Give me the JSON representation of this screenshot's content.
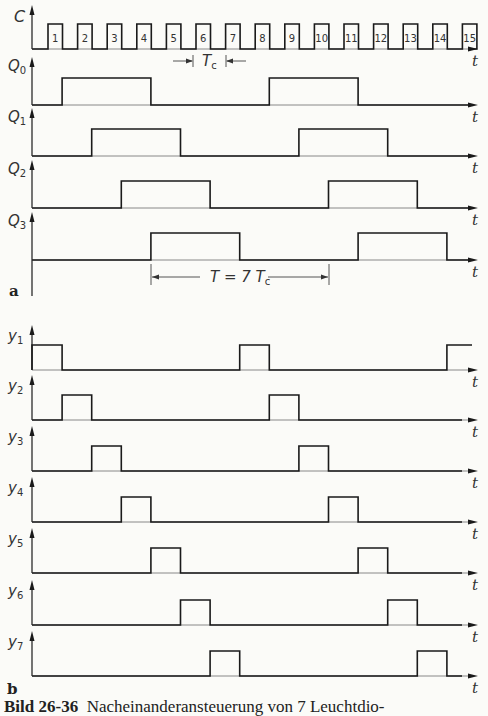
{
  "figure": {
    "caption_number": "Bild 26-36",
    "caption_text": "Nacheinanderansteuerung von 7 Leuchtdio-",
    "panel_a_label": "a",
    "panel_b_label": "b",
    "time_axis_label": "t",
    "clock_period_label": "T",
    "clock_period_sub": "c",
    "cycle_label": "T = 7 T",
    "cycle_label_sub": "c"
  },
  "colors": {
    "line": "#1a1a1a",
    "background": "#fbfbf8"
  },
  "chart_data": {
    "type": "timing",
    "xlabel": "t",
    "time_unit": "clock periods T_c",
    "clock": {
      "name": "C",
      "pulses": [
        1,
        2,
        3,
        4,
        5,
        6,
        7,
        8,
        9,
        10,
        11,
        12,
        13,
        14,
        15
      ]
    },
    "panel_a": [
      {
        "name": "Q",
        "sub": "0",
        "high_intervals": [
          [
            1,
            4
          ],
          [
            8,
            11
          ]
        ]
      },
      {
        "name": "Q",
        "sub": "1",
        "high_intervals": [
          [
            2,
            5
          ],
          [
            9,
            12
          ]
        ]
      },
      {
        "name": "Q",
        "sub": "2",
        "high_intervals": [
          [
            3,
            6
          ],
          [
            10,
            13
          ]
        ]
      },
      {
        "name": "Q",
        "sub": "3",
        "high_intervals": [
          [
            4,
            7
          ],
          [
            11,
            14
          ]
        ]
      }
    ],
    "panel_b": [
      {
        "name": "y",
        "sub": "1",
        "high_intervals": [
          [
            0,
            1
          ],
          [
            7,
            8
          ],
          [
            14,
            15
          ]
        ]
      },
      {
        "name": "y",
        "sub": "2",
        "high_intervals": [
          [
            1,
            2
          ],
          [
            8,
            9
          ]
        ]
      },
      {
        "name": "y",
        "sub": "3",
        "high_intervals": [
          [
            2,
            3
          ],
          [
            9,
            10
          ]
        ]
      },
      {
        "name": "y",
        "sub": "4",
        "high_intervals": [
          [
            3,
            4
          ],
          [
            10,
            11
          ]
        ]
      },
      {
        "name": "y",
        "sub": "5",
        "high_intervals": [
          [
            4,
            5
          ],
          [
            11,
            12
          ]
        ]
      },
      {
        "name": "y",
        "sub": "6",
        "high_intervals": [
          [
            5,
            6
          ],
          [
            12,
            13
          ]
        ]
      },
      {
        "name": "y",
        "sub": "7",
        "high_intervals": [
          [
            6,
            7
          ],
          [
            13,
            14
          ]
        ]
      }
    ],
    "annotations": [
      "T_c = one clock period",
      "T = 7 T_c (period of each output)"
    ]
  }
}
